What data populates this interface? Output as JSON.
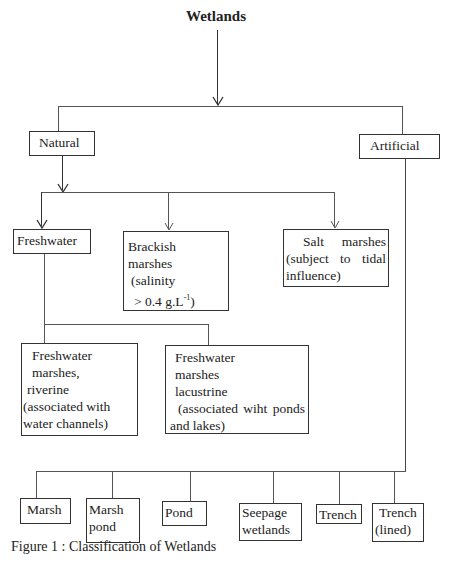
{
  "title": "Wetlands",
  "level1": {
    "natural": "Natural",
    "artificial": "Artificial"
  },
  "natural_children": {
    "freshwater": "Freshwater",
    "brackish": {
      "line1": "Brackish",
      "line2": "marshes",
      "line3": "(salinity",
      "line4": "> 0.4 g.L",
      "sup": "-1",
      "line4_end": ")"
    },
    "salt": {
      "line1a": "Salt",
      "line1b": "marshes",
      "line2": "(subject to tidal",
      "line3": "influence)"
    }
  },
  "freshwater_children": {
    "riverine": {
      "line1": "Freshwater",
      "line2": "marshes,",
      "line3": "riverine",
      "line4": "(associated with",
      "line5": "water channels)"
    },
    "lacustrine": {
      "line1": "Freshwater",
      "line2": "marshes",
      "line3": "lacustrine",
      "line4": "(associated wiht ponds",
      "line5": "and lakes)"
    }
  },
  "artificial_children": [
    {
      "line1": "Marsh"
    },
    {
      "line1": "Marsh",
      "line2": "pond"
    },
    {
      "line1": "Pond"
    },
    {
      "line1": "Seepage",
      "line2": "wetlands"
    },
    {
      "line1": "Trench"
    },
    {
      "line1": "Trench",
      "line2": "(lined)"
    }
  ],
  "caption": "Figure 1 : Classification of Wetlands"
}
